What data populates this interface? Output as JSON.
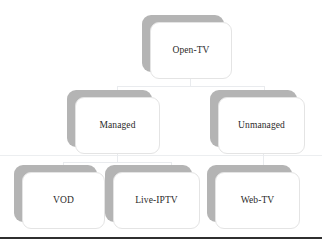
{
  "diagram": {
    "type": "hierarchy-tree",
    "background_color": "#ffffff",
    "box_fill_color": "#ffffff",
    "box_border_color": "#e4e4e4",
    "box_shadow_color": "#b4b4b4",
    "connector_color": "#e9ebee",
    "bottom_rule_color": "#2f2f2f",
    "text_color": "#2a2a2a",
    "levels": [
      {
        "level": 1,
        "nodes": [
          {
            "id": "open-tv",
            "label": "Open-TV"
          }
        ]
      },
      {
        "level": 2,
        "nodes": [
          {
            "id": "managed",
            "label": "Managed"
          },
          {
            "id": "unmanaged",
            "label": "Unmanaged"
          }
        ]
      },
      {
        "level": 3,
        "nodes": [
          {
            "id": "vod",
            "label": "VOD"
          },
          {
            "id": "live-iptv",
            "label": "Live-IPTV"
          },
          {
            "id": "web-tv",
            "label": "Web-TV"
          }
        ]
      }
    ],
    "edges": [
      {
        "from": "open-tv",
        "to": "managed"
      },
      {
        "from": "open-tv",
        "to": "unmanaged"
      },
      {
        "from": "managed",
        "to": "vod"
      },
      {
        "from": "managed",
        "to": "live-iptv"
      },
      {
        "from": "unmanaged",
        "to": "web-tv"
      }
    ]
  }
}
